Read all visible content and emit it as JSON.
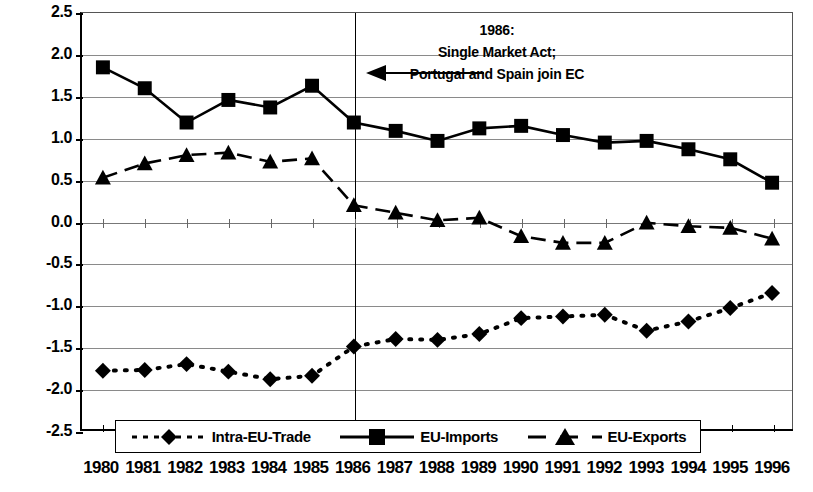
{
  "chart_data": {
    "type": "line",
    "title": "",
    "xlabel": "",
    "ylabel": "Percent (estimated from gravity model)",
    "categories": [
      "1980",
      "1981",
      "1982",
      "1983",
      "1984",
      "1985",
      "1986",
      "1987",
      "1988",
      "1989",
      "1990",
      "1991",
      "1992",
      "1993",
      "1994",
      "1995",
      "1996"
    ],
    "ylim": [
      -2.5,
      2.5
    ],
    "ytick_values": [
      2.5,
      2.0,
      1.5,
      1.0,
      0.5,
      0.0,
      -0.5,
      -1.0,
      -1.5,
      -2.0,
      -2.5
    ],
    "ytick_labels": [
      "2.5",
      "2.0",
      "1.5",
      "1.0",
      "0.5",
      "0.0",
      "-0.5",
      "-1.0",
      "-1.5",
      "-2.0",
      "-2.5"
    ],
    "grid": true,
    "legend_position": "bottom",
    "series": [
      {
        "name": "Intra-EU-Trade",
        "marker": "diamond",
        "line_style": "dotted",
        "values": [
          -1.78,
          -1.77,
          -1.7,
          -1.79,
          -1.88,
          -1.84,
          -1.49,
          -1.4,
          -1.41,
          -1.34,
          -1.15,
          -1.13,
          -1.11,
          -1.3,
          -1.19,
          -1.03,
          -0.85
        ]
      },
      {
        "name": "EU-Imports",
        "marker": "square",
        "line_style": "solid",
        "values": [
          1.85,
          1.6,
          1.19,
          1.46,
          1.37,
          1.63,
          1.19,
          1.09,
          0.97,
          1.12,
          1.15,
          1.04,
          0.95,
          0.97,
          0.87,
          0.75,
          0.47
        ]
      },
      {
        "name": "EU-Exports",
        "marker": "triangle",
        "line_style": "dashed",
        "values": [
          0.53,
          0.7,
          0.8,
          0.83,
          0.72,
          0.76,
          0.2,
          0.11,
          0.02,
          0.05,
          -0.17,
          -0.25,
          -0.25,
          -0.01,
          -0.05,
          -0.07,
          -0.2
        ]
      }
    ],
    "annotations": [
      {
        "name": "event-marker-1986",
        "at_category": "1986",
        "lines": [
          "1986:",
          "Single Market Act;",
          "Portugal and Spain join EC"
        ],
        "arrow": "left"
      }
    ]
  },
  "legend": {
    "entries": [
      {
        "label": "Intra-EU-Trade",
        "marker": "diamond",
        "line_style": "dotted"
      },
      {
        "label": "EU-Imports",
        "marker": "square",
        "line_style": "solid"
      },
      {
        "label": "EU-Exports",
        "marker": "triangle",
        "line_style": "dashed"
      }
    ]
  },
  "colors": {
    "series": "#000000",
    "grid": "#8a8a8a",
    "axis": "#000000",
    "background": "#ffffff"
  }
}
